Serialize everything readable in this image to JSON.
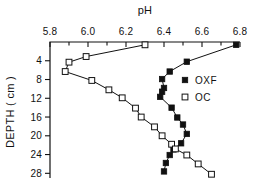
{
  "chart_data": {
    "type": "line",
    "title": "pH",
    "xlabel": "pH",
    "ylabel": "DEPTH ( cm )",
    "xlim": [
      5.8,
      6.8
    ],
    "ylim": [
      0,
      29
    ],
    "x_axis_position": "top",
    "y_axis_inverted": true,
    "grid": false,
    "legend_position": "right",
    "xticks": [
      "5.8",
      "6.0",
      "6.2",
      "6.4",
      "6.6",
      "6.8"
    ],
    "xtick_values": [
      5.8,
      6.0,
      6.2,
      6.4,
      6.6,
      6.8
    ],
    "xminor_count": 1,
    "yticks": [
      "4",
      "8",
      "12",
      "16",
      "20",
      "24",
      "28"
    ],
    "ytick_values": [
      4,
      8,
      12,
      16,
      20,
      24,
      28
    ],
    "series": [
      {
        "name": "OXF",
        "marker": "filled-square",
        "x": [
          6.78,
          6.52,
          6.43,
          6.39,
          6.4,
          6.39,
          6.38,
          6.44,
          6.47,
          6.5,
          6.52,
          6.49,
          6.45,
          6.43,
          6.41,
          6.4
        ],
        "y": [
          0.6,
          4.2,
          6.3,
          7.9,
          9.8,
          10.6,
          11.7,
          14.0,
          16.1,
          17.6,
          19.6,
          21.6,
          22.9,
          24.1,
          25.8,
          27.6
        ],
        "values": [
          {
            "ph": 6.78,
            "depth": 0.6
          },
          {
            "ph": 6.52,
            "depth": 4.2
          },
          {
            "ph": 6.43,
            "depth": 6.3
          },
          {
            "ph": 6.39,
            "depth": 7.9
          },
          {
            "ph": 6.4,
            "depth": 9.8
          },
          {
            "ph": 6.39,
            "depth": 10.6
          },
          {
            "ph": 6.38,
            "depth": 11.7
          },
          {
            "ph": 6.44,
            "depth": 14.0
          },
          {
            "ph": 6.47,
            "depth": 16.1
          },
          {
            "ph": 6.5,
            "depth": 17.6
          },
          {
            "ph": 6.52,
            "depth": 19.6
          },
          {
            "ph": 6.49,
            "depth": 21.6
          },
          {
            "ph": 6.45,
            "depth": 22.9
          },
          {
            "ph": 6.43,
            "depth": 24.1
          },
          {
            "ph": 6.41,
            "depth": 25.8
          },
          {
            "ph": 6.4,
            "depth": 27.6
          }
        ]
      },
      {
        "name": "OC",
        "marker": "open-square",
        "x": [
          6.3,
          5.99,
          5.9,
          5.88,
          6.02,
          6.11,
          6.18,
          6.25,
          6.28,
          6.35,
          6.39,
          6.44,
          6.46,
          6.52,
          6.58,
          6.65
        ],
        "y": [
          0.6,
          3.1,
          4.3,
          6.3,
          8.2,
          10.2,
          11.9,
          14.1,
          16.0,
          18.1,
          20.0,
          21.8,
          22.8,
          24.1,
          26.0,
          28.2
        ],
        "values": [
          {
            "ph": 6.3,
            "depth": 0.6
          },
          {
            "ph": 5.99,
            "depth": 3.1
          },
          {
            "ph": 5.9,
            "depth": 4.3
          },
          {
            "ph": 5.88,
            "depth": 6.3
          },
          {
            "ph": 6.02,
            "depth": 8.2
          },
          {
            "ph": 6.11,
            "depth": 10.2
          },
          {
            "ph": 6.18,
            "depth": 11.9
          },
          {
            "ph": 6.25,
            "depth": 14.1
          },
          {
            "ph": 6.28,
            "depth": 16.0
          },
          {
            "ph": 6.35,
            "depth": 18.1
          },
          {
            "ph": 6.39,
            "depth": 20.0
          },
          {
            "ph": 6.44,
            "depth": 21.8
          },
          {
            "ph": 6.46,
            "depth": 22.8
          },
          {
            "ph": 6.52,
            "depth": 24.1
          },
          {
            "ph": 6.58,
            "depth": 26.0
          },
          {
            "ph": 6.65,
            "depth": 28.2
          }
        ]
      }
    ],
    "legend": [
      {
        "label": "OXF",
        "marker": "filled-square"
      },
      {
        "label": "OC",
        "marker": "open-square"
      }
    ],
    "colors": {
      "line": "#111111",
      "marker_fill": "#111111",
      "marker_open_fill": "#ffffff",
      "background": "#ffffff"
    }
  }
}
